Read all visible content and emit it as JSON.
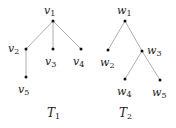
{
  "figure": {
    "trees": [
      {
        "name": "T",
        "name_sub": "1",
        "title_pos": [
          47,
          117
        ],
        "nodes": [
          {
            "id": "v1",
            "base": "v",
            "sub": "1",
            "x": 53,
            "y": 21,
            "lx": 44,
            "ly": 14
          },
          {
            "id": "v2",
            "base": "v",
            "sub": "2",
            "x": 26,
            "y": 49,
            "lx": 8,
            "ly": 52
          },
          {
            "id": "v3",
            "base": "v",
            "sub": "3",
            "x": 53,
            "y": 49,
            "lx": 45,
            "ly": 65
          },
          {
            "id": "v4",
            "base": "v",
            "sub": "4",
            "x": 81,
            "y": 49,
            "lx": 73,
            "ly": 65
          },
          {
            "id": "v5",
            "base": "v",
            "sub": "5",
            "x": 26,
            "y": 77,
            "lx": 18,
            "ly": 93
          }
        ],
        "edges": [
          [
            "v1",
            "v2"
          ],
          [
            "v1",
            "v3"
          ],
          [
            "v1",
            "v4"
          ],
          [
            "v2",
            "v5"
          ]
        ]
      },
      {
        "name": "T",
        "name_sub": "2",
        "title_pos": [
          119,
          117
        ],
        "nodes": [
          {
            "id": "w1",
            "base": "w",
            "sub": "1",
            "x": 125,
            "y": 21,
            "lx": 117,
            "ly": 14
          },
          {
            "id": "w2",
            "base": "w",
            "sub": "2",
            "x": 108,
            "y": 50,
            "lx": 100,
            "ly": 66
          },
          {
            "id": "w3",
            "base": "w",
            "sub": "3",
            "x": 142,
            "y": 51,
            "lx": 147,
            "ly": 54
          },
          {
            "id": "w4",
            "base": "w",
            "sub": "4",
            "x": 125,
            "y": 79,
            "lx": 117,
            "ly": 95
          },
          {
            "id": "w5",
            "base": "w",
            "sub": "5",
            "x": 160,
            "y": 80,
            "lx": 152,
            "ly": 96
          }
        ],
        "edges": [
          [
            "w1",
            "w2"
          ],
          [
            "w1",
            "w3"
          ],
          [
            "w3",
            "w4"
          ],
          [
            "w3",
            "w5"
          ]
        ]
      }
    ],
    "colors": {
      "edge": "#9a9a9a",
      "node": "#111111",
      "text": "#222222"
    }
  }
}
